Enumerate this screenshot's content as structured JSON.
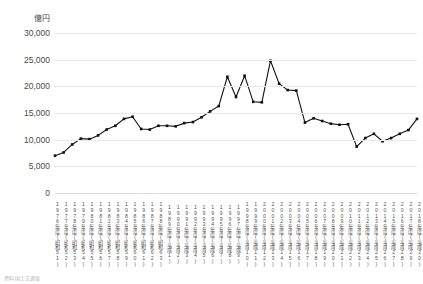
{
  "chart_data": {
    "type": "line",
    "title": "",
    "xlabel": "",
    "ylabel": "億円",
    "ylim": [
      0,
      30000
    ],
    "yticks": [
      0,
      5000,
      10000,
      15000,
      20000,
      25000,
      30000
    ],
    "ytick_labels": [
      "0",
      "5,000",
      "10,000",
      "15,000",
      "20,000",
      "25,000",
      "30,000"
    ],
    "grid": true,
    "legend": "none",
    "marker": "square",
    "series_color": "#111111",
    "categories": [
      "1976年度(昭和51)",
      "1977年度(昭和52)",
      "1978年度(昭和53)",
      "1979年度(昭和54)",
      "1980年度(昭和55)",
      "1981年度(昭和56)",
      "1982年度(昭和57)",
      "1983年度(昭和58)",
      "1984年度(昭和59)",
      "1985年度(昭和60)",
      "1986年度(昭和61)",
      "1987年度(昭和62)",
      "1988年度(昭和63)",
      "1989年度(平成1)",
      "1990年度(平成2)",
      "1991年度(平成3)",
      "1992年度(平成4)",
      "1993年度(平成5)",
      "1994年度(平成6)",
      "1995年度(平成7)",
      "1996年度(平成8)",
      "1997年度(平成9)",
      "1998年度(平成10)",
      "1999年度(平成11)",
      "2000年度(平成12)",
      "2001年度(平成13)",
      "2002年度(平成14)",
      "2003年度(平成15)",
      "2004年度(平成16)",
      "2005年度(平成17)",
      "2006年度(平成18)",
      "2007年度(平成19)",
      "2008年度(平成20)",
      "2009年度(平成21)",
      "2010年度(平成22)",
      "2011年度(平成23)",
      "2012年度(平成24)",
      "2013年度(平成25)",
      "2014年度(平成26)",
      "2015年度(平成27)",
      "2016年度(平成28)",
      "2017年度(平成29)",
      "2018年度(平成30)"
    ],
    "series": [
      {
        "name": "金額",
        "values": [
          7000,
          7600,
          9100,
          10200,
          10100,
          10800,
          11900,
          12600,
          13900,
          14300,
          12000,
          11900,
          12600,
          12600,
          12500,
          13100,
          13300,
          14200,
          15300,
          16300,
          21800,
          18000,
          22000,
          17100,
          17000,
          24800,
          20500,
          19300,
          19200,
          13200,
          14000,
          13500,
          13000,
          12800,
          12900,
          8700,
          10300,
          11100,
          9700,
          10300,
          11100,
          11800,
          13900
        ]
      }
    ]
  },
  "footnote": {
    "text": "資料:国土交通省"
  }
}
